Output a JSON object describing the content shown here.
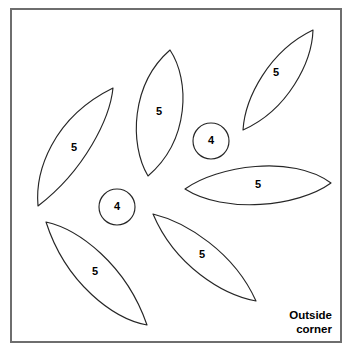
{
  "figure": {
    "background_color": "#ffffff",
    "frame": {
      "stroke_color": "#6e6e6e",
      "x": 11,
      "y": 9,
      "width": 330,
      "height": 333
    },
    "caption": {
      "line1": "Outside",
      "line2": "corner"
    },
    "shape_stroke_color": "#262626",
    "shape_fill_color": "#ffffff",
    "pieces": [
      {
        "id": "petal-left",
        "name": "left-petal",
        "shape": "lens",
        "label": "5",
        "label_x": 74,
        "label_y": 148,
        "path": "M 113 88 C 110 118 85 170 38 206 C 35 172 52 118 113 88 Z"
      },
      {
        "id": "petal-top-middle",
        "name": "top-middle-petal",
        "shape": "lens",
        "label": "5",
        "label_x": 159,
        "label_y": 112,
        "path": "M 170 50 C 190 80 190 140 148 176 C 129 144 131 84 170 50 Z"
      },
      {
        "id": "petal-top-right",
        "name": "top-right-petal",
        "shape": "lens",
        "label": "5",
        "label_x": 276,
        "label_y": 73,
        "path": "M 313 30 C 312 62 288 110 243 130 C 245 98 269 51 313 30 Z"
      },
      {
        "id": "petal-right",
        "name": "right-petal",
        "shape": "lens",
        "label": "5",
        "label_x": 258,
        "label_y": 185,
        "path": "M 185 189 C 217 166 292 154 331 183 C 298 207 224 214 185 189 Z"
      },
      {
        "id": "petal-bottom-left",
        "name": "bottom-left-petal",
        "shape": "lens",
        "label": "5",
        "label_x": 95,
        "label_y": 272,
        "path": "M 46 222 C 78 229 126 264 147 325 C 114 319 66 284 46 222 Z"
      },
      {
        "id": "petal-bottom-right",
        "name": "bottom-right-petal",
        "shape": "lens",
        "label": "5",
        "label_x": 202,
        "label_y": 255,
        "path": "M 153 214 C 186 222 234 252 256 301 C 223 295 175 266 153 214 Z"
      },
      {
        "id": "circle-upper",
        "name": "upper-circle",
        "shape": "circle",
        "label": "4",
        "label_x": 211,
        "label_y": 141,
        "cx": 211,
        "cy": 141,
        "r": 18
      },
      {
        "id": "circle-lower",
        "name": "lower-circle",
        "shape": "circle",
        "label": "4",
        "label_x": 117,
        "label_y": 207,
        "cx": 117,
        "cy": 207,
        "r": 18
      }
    ]
  }
}
